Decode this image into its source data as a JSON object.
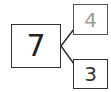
{
  "diagram": {
    "type": "number-bond",
    "whole": {
      "value": "7",
      "color": "#222222"
    },
    "parts": [
      {
        "value": "4",
        "color": "#9a9a9a"
      },
      {
        "value": "3",
        "color": "#333333"
      }
    ],
    "line_color": "#222222"
  }
}
